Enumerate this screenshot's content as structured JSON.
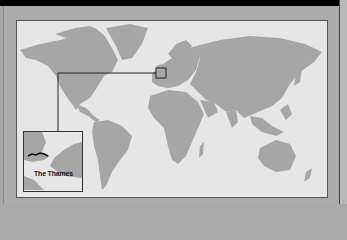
{
  "map": {
    "type": "world-map",
    "highlight_region": "Southern England / London",
    "inset": {
      "label": "The Thames",
      "feature": "river-thames"
    }
  },
  "colors": {
    "land": "#a6a6a6",
    "water": "#e6e6e6",
    "frame_border": "#555555",
    "river": "#111111"
  }
}
